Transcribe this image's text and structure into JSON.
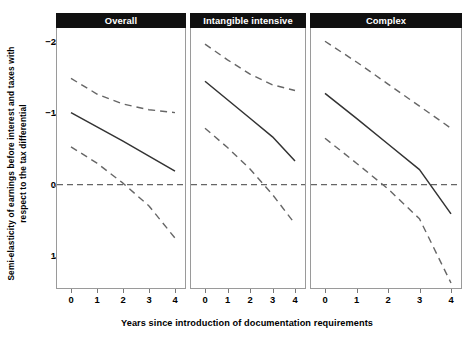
{
  "chart_data": {
    "type": "line",
    "title": "",
    "xlabel": "Years since introduction of documentation requirements",
    "ylabel": "Semi-elasticity of earnings before interest and taxes with respect to the tax differential",
    "x": [
      0,
      1,
      2,
      3,
      4
    ],
    "xlim": [
      0,
      4
    ],
    "ylim": [
      -2.3,
      1.3
    ],
    "y_inverted": true,
    "xticks": [
      "0",
      "1",
      "2",
      "3",
      "4"
    ],
    "yticks": [
      "-2",
      "-1",
      "0",
      "1"
    ],
    "ytick_values": [
      -2,
      -1,
      0,
      1
    ],
    "grid": false,
    "legend": false,
    "reference_line": {
      "y": 0,
      "style": "dashed"
    },
    "panels": [
      {
        "label": "Overall",
        "series": [
          {
            "name": "Upper confidence bound",
            "style": "dashed",
            "values": [
              -1.49,
              -1.27,
              -1.13,
              -1.05,
              -1.01
            ]
          },
          {
            "name": "Point estimate",
            "style": "solid",
            "values": [
              -1.01,
              -0.81,
              -0.61,
              -0.4,
              -0.19
            ]
          },
          {
            "name": "Lower confidence bound",
            "style": "dashed",
            "values": [
              -0.53,
              -0.3,
              -0.02,
              0.3,
              0.75
            ]
          }
        ]
      },
      {
        "label": "Intangible intensive",
        "series": [
          {
            "name": "Upper confidence bound",
            "style": "dashed",
            "values": [
              -1.97,
              -1.75,
              -1.55,
              -1.4,
              -1.32
            ]
          },
          {
            "name": "Point estimate",
            "style": "solid",
            "values": [
              -1.45,
              -1.19,
              -0.93,
              -0.67,
              -0.33
            ]
          },
          {
            "name": "Lower confidence bound",
            "style": "dashed",
            "values": [
              -0.79,
              -0.52,
              -0.22,
              0.14,
              0.55
            ]
          }
        ]
      },
      {
        "label": "Complex",
        "series": [
          {
            "name": "Upper confidence bound",
            "style": "dashed",
            "values": [
              -2.01,
              -1.72,
              -1.41,
              -1.1,
              -0.79
            ]
          },
          {
            "name": "Point estimate",
            "style": "solid",
            "values": [
              -1.28,
              -0.93,
              -0.57,
              -0.21,
              0.41
            ]
          },
          {
            "name": "Lower confidence bound",
            "style": "dashed",
            "values": [
              -0.65,
              -0.3,
              0.06,
              0.48,
              1.38
            ]
          }
        ]
      }
    ]
  },
  "axes": {
    "xlabel": "Years since introduction of documentation requirements",
    "ylabel": "Semi-elasticity of earnings before interest and taxes with respect to the tax differential",
    "ytick_labels": [
      "-2",
      "-1",
      "0",
      "1"
    ],
    "xtick_labels": [
      "0",
      "1",
      "2",
      "3",
      "4"
    ]
  },
  "panels": {
    "p0_label": "Overall",
    "p1_label": "Intangible intensive",
    "p2_label": "Complex"
  },
  "colors": {
    "line": "#333333",
    "dash": "#666666",
    "strip_bg": "#101010",
    "strip_fg": "#ffffff",
    "panel_border": "#9a9a9a",
    "background": "#ffffff"
  }
}
